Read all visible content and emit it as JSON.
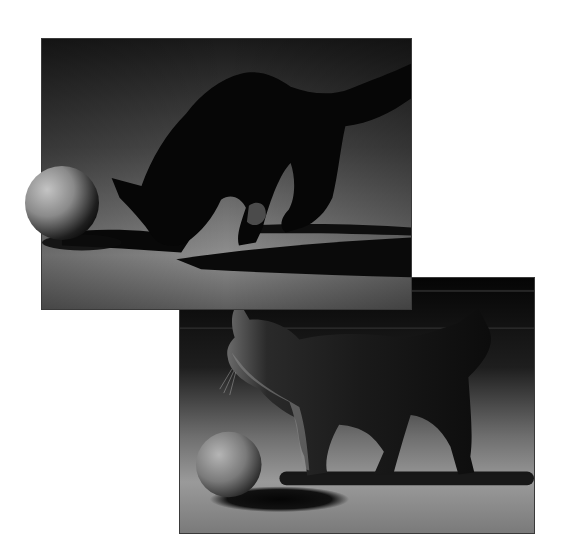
{
  "composition": {
    "description": "Two overlapping black-and-white studio photographs of a fluffy kitten with a ball",
    "background_color": "#ffffff"
  },
  "photos": [
    {
      "id": "top",
      "subject": "kitten silhouette sniffing ball, tail raised",
      "tones": {
        "shadow": "#050505",
        "floor_light": "#8a8a8a",
        "backdrop_dark": "#2a2a2a"
      },
      "ball_breaks_frame": true
    },
    {
      "id": "bottom",
      "subject": "kitten walking left past ball, rim-lit fur",
      "tones": {
        "shadow": "#060606",
        "floor_light": "#9a9a9a",
        "backdrop_dark": "#0a0a0a"
      },
      "ball_breaks_frame": false
    }
  ]
}
